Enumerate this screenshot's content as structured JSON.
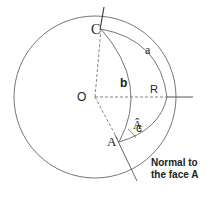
{
  "diagram": {
    "type": "spherical-triangle-crystallography",
    "labels": {
      "center": "O",
      "vertex_c": "C",
      "vertex_a": "A",
      "radius": "R",
      "side_a": "a",
      "side_b": "b",
      "side_c": "c",
      "angle_a": "Â",
      "normal_line_1": "Normal to",
      "normal_line_2": "the face A"
    },
    "colors": {
      "stroke": "#555555",
      "text": "#222222",
      "background": "#ffffff"
    }
  }
}
